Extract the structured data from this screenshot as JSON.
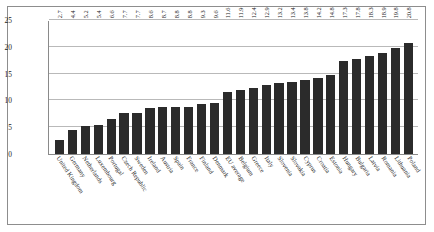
{
  "chart_data": {
    "type": "bar",
    "title": "",
    "subtitle": "",
    "xlabel": "",
    "ylabel": "",
    "ylim": [
      0,
      25
    ],
    "yticks": [
      "0",
      "5",
      "10",
      "15",
      "20",
      "25"
    ],
    "grid": true,
    "legend": false,
    "bar_color": "#2b2b2b",
    "categories": [
      "United Kingdom",
      "Germany",
      "Netherlands",
      "Luxembourg",
      "Portugal",
      "Czech Republic",
      "Sweden",
      "Ireland",
      "Austria",
      "Spain",
      "France",
      "Finland",
      "Denmark",
      "EU average",
      "Belgium",
      "Greece",
      "Italy",
      "Slovenia",
      "Slovakia",
      "Cyprus",
      "Croatia",
      "Estonia",
      "Hungary",
      "Bulgaria",
      "Latvia",
      "Romania",
      "Lithuania",
      "Poland"
    ],
    "values": [
      2.7,
      4.4,
      5.2,
      5.4,
      6.6,
      7.7,
      7.7,
      8.6,
      8.7,
      8.8,
      8.8,
      9.3,
      9.6,
      11.6,
      11.9,
      12.4,
      12.9,
      13.2,
      13.4,
      13.8,
      14.2,
      14.8,
      17.3,
      17.8,
      18.3,
      18.9,
      19.8,
      20.8
    ],
    "value_labels": [
      "2.7",
      "4.4",
      "5.2",
      "5.4",
      "6.6",
      "7.7",
      "7.7",
      "8.6",
      "8.7",
      "8.8",
      "8.8",
      "9.3",
      "9.6",
      "11.6",
      "11.9",
      "12.4",
      "12.9",
      "13.2",
      "13.4",
      "13.8",
      "14.2",
      "14.8",
      "17.3",
      "17.8",
      "18.3",
      "18.9",
      "19.8",
      "20.8"
    ]
  }
}
